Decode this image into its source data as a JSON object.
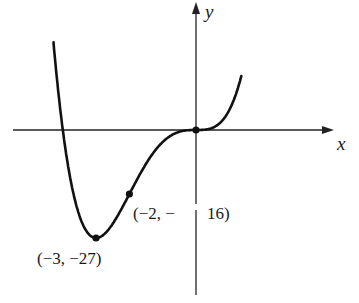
{
  "chart_data": {
    "type": "line",
    "title": "",
    "function": "y = x^4 + 4x^3",
    "xlabel": "x",
    "ylabel": "y",
    "grid": false,
    "legend": null,
    "x": [
      -4.3,
      -4,
      -3.5,
      -3,
      -2.5,
      -2,
      -1.5,
      -1,
      -0.5,
      0,
      0.5,
      1,
      1.35
    ],
    "series": [
      {
        "name": "curve",
        "values": [
          24.6,
          0,
          -21.4,
          -27,
          -23.4,
          -16,
          -8.4,
          -3,
          -0.44,
          0,
          0.56,
          5,
          13.2
        ]
      }
    ],
    "annotations": [
      {
        "x": -3,
        "y": -27,
        "label": "(−3, −27)",
        "kind": "local minimum"
      },
      {
        "x": -2,
        "y": -16,
        "label": "(−2, −16)",
        "kind": "inflection point"
      },
      {
        "x": 0,
        "y": 0,
        "label": "",
        "kind": "inflection point (origin)"
      }
    ]
  },
  "labels": {
    "x_axis": "x",
    "y_axis": "y",
    "point_min": "(−3, −27)",
    "point_inflection_left": "(−2, −",
    "point_inflection_right": "16)"
  },
  "colors": {
    "curve": "#111111",
    "axes": "#222222",
    "background": "#ffffff"
  }
}
